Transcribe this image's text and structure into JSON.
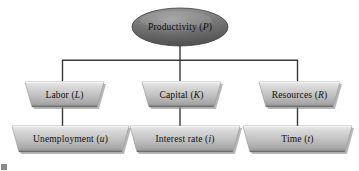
{
  "diagram": {
    "type": "tree",
    "colors": {
      "root_fill_dark": "#5c5c5c",
      "root_fill_light": "#9a9a9a",
      "node_fill_light": "#e2e2e2",
      "node_fill_mid": "#b9b9b9",
      "node_fill_dark": "#8e8e8e",
      "connector": "#3a3a3a",
      "text": "#111111",
      "background": "#ffffff"
    },
    "root": {
      "id": "productivity",
      "shape": "ellipse",
      "text": "Productivity (P)",
      "label_main": "Productivity (",
      "label_symbol": "P",
      "label_close": ")"
    },
    "level2": [
      {
        "id": "labor",
        "shape": "parallelogram",
        "text": "Labor (L)",
        "label_main": "Labor (",
        "label_symbol": "L",
        "label_close": ")"
      },
      {
        "id": "capital",
        "shape": "parallelogram",
        "text": "Capital (K)",
        "label_main": "Capital (",
        "label_symbol": "K",
        "label_close": ")"
      },
      {
        "id": "resources",
        "shape": "parallelogram",
        "text": "Resources (R)",
        "label_main": "Resources (",
        "label_symbol": "R",
        "label_close": ")"
      }
    ],
    "level3": [
      {
        "id": "unemployment",
        "shape": "parallelogram",
        "text": "Unemployment (u)",
        "label_main": "Unemployment (",
        "label_symbol": "u",
        "label_close": ")"
      },
      {
        "id": "interest-rate",
        "shape": "parallelogram",
        "text": "Interest rate (i)",
        "label_main": "Interest rate (",
        "label_symbol": "i",
        "label_close": ")"
      },
      {
        "id": "time",
        "shape": "parallelogram",
        "text": "Time (t)",
        "label_main": "Time (",
        "label_symbol": "t",
        "label_close": ")"
      }
    ],
    "edges": [
      {
        "from": "productivity",
        "to": "bus"
      },
      {
        "from": "bus",
        "to": "labor"
      },
      {
        "from": "bus",
        "to": "capital"
      },
      {
        "from": "bus",
        "to": "resources"
      },
      {
        "from": "labor",
        "to": "unemployment"
      },
      {
        "from": "capital",
        "to": "interest-rate"
      },
      {
        "from": "resources",
        "to": "time"
      }
    ]
  }
}
